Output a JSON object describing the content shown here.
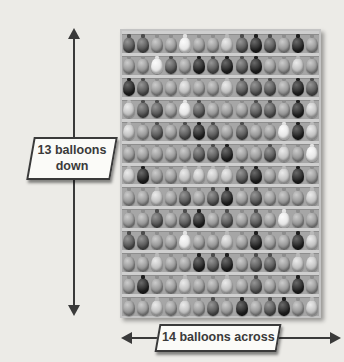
{
  "figure": {
    "bg_color": "#ecebe7",
    "arrow_color": "#3a3a3a",
    "left_callout": {
      "text": "13 balloons down"
    },
    "bottom_callout": {
      "text": "14 balloons across"
    },
    "callout_style": {
      "fill": "#fbfbf8",
      "border": "#3a3a3a",
      "text_color": "#3a3a3a"
    }
  },
  "grid": {
    "columns": 14,
    "rows_count": 13,
    "bg": "#a6a6a6",
    "border": "#c4c4c4",
    "rod_color": "#cfcfcf",
    "tones": {
      "1": {
        "base": "#1f1f1f",
        "hi": "#6a6a6a"
      },
      "2": {
        "base": "#4d4d4d",
        "hi": "#969696"
      },
      "3": {
        "base": "#8d8d8d",
        "hi": "#cccccc"
      },
      "4": {
        "base": "#b9b9b9",
        "hi": "#ebebeb"
      },
      "5": {
        "base": "#e2e2e2",
        "hi": "#fbfbfb"
      }
    },
    "rows": [
      [
        2,
        2,
        3,
        3,
        5,
        3,
        3,
        4,
        2,
        1,
        2,
        3,
        1,
        3
      ],
      [
        3,
        3,
        5,
        2,
        3,
        1,
        2,
        1,
        2,
        1,
        3,
        3,
        4,
        3
      ],
      [
        1,
        2,
        3,
        3,
        4,
        3,
        3,
        4,
        2,
        2,
        2,
        3,
        1,
        2
      ],
      [
        4,
        2,
        2,
        3,
        5,
        2,
        3,
        3,
        3,
        2,
        2,
        3,
        1,
        4
      ],
      [
        4,
        3,
        2,
        3,
        2,
        1,
        2,
        3,
        2,
        3,
        3,
        5,
        1,
        4
      ],
      [
        3,
        3,
        3,
        3,
        3,
        2,
        2,
        1,
        3,
        3,
        2,
        4,
        3,
        5
      ],
      [
        4,
        1,
        3,
        3,
        4,
        4,
        4,
        4,
        2,
        1,
        3,
        4,
        1,
        3
      ],
      [
        3,
        3,
        4,
        3,
        2,
        3,
        2,
        1,
        3,
        2,
        3,
        3,
        3,
        4
      ],
      [
        3,
        3,
        2,
        3,
        2,
        1,
        3,
        2,
        3,
        2,
        3,
        5,
        3,
        3
      ],
      [
        2,
        2,
        3,
        3,
        5,
        3,
        3,
        4,
        3,
        1,
        3,
        3,
        1,
        4
      ],
      [
        3,
        3,
        4,
        3,
        3,
        1,
        2,
        1,
        3,
        2,
        2,
        3,
        4,
        4
      ],
      [
        3,
        1,
        3,
        3,
        4,
        3,
        3,
        4,
        3,
        2,
        3,
        3,
        1,
        3
      ],
      [
        3,
        3,
        4,
        3,
        4,
        3,
        2,
        3,
        1,
        3,
        2,
        1,
        3,
        4
      ]
    ]
  }
}
